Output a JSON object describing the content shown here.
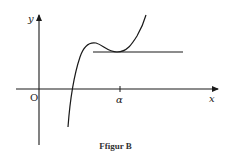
{
  "figure": {
    "caption": "Ffigur B",
    "axes": {
      "x_label": "x",
      "y_label": "y",
      "origin_label": "O",
      "x_tick_label": "α"
    },
    "elements": [
      {
        "type": "curve",
        "description": "cubic-like curve rising from below x-axis, local max then local min touching horizontal line at α, then rising"
      },
      {
        "type": "horizontal-line",
        "description": "tangent line at local minimum, at x = α"
      }
    ],
    "colors": {
      "stroke": "#1a1a1a",
      "background": "#ffffff"
    }
  }
}
